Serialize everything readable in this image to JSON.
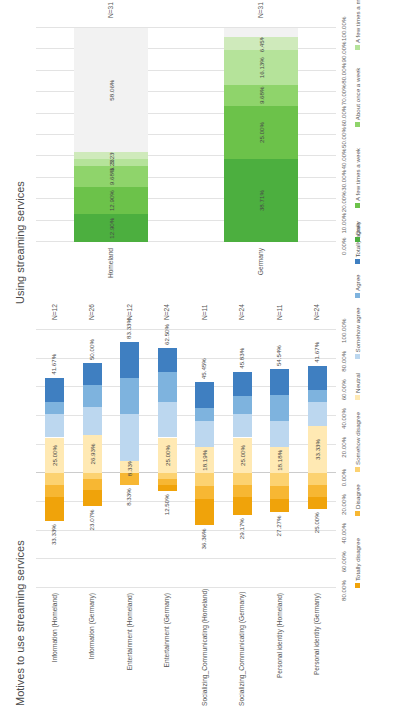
{
  "charts": {
    "motives": {
      "title": "Motives to use streaming services",
      "type": "diverging-bar",
      "categories": [
        "Information (Homeland)",
        "Information (Germany)",
        "Entertainment (Homeland)",
        "Entertainment (Germany)",
        "Socializing_Communicating (Homeland)",
        "Socializing_Communicating (Germany)",
        "Personal identity (Homeland)",
        "Personal identity (Germany)"
      ],
      "n_labels": [
        "N=12",
        "N=26",
        "N=12",
        "N=24",
        "N=11",
        "N=24",
        "N=11",
        "N=24"
      ],
      "legend": [
        {
          "label": "Totally disagree",
          "color": "#f0a30a"
        },
        {
          "label": "Disagree",
          "color": "#f7b733"
        },
        {
          "label": "Somehow disagree",
          "color": "#fcd271"
        },
        {
          "label": "Neutral",
          "color": "#ffe9b3"
        },
        {
          "label": "Somehow agree",
          "color": "#bcd7ef"
        },
        {
          "label": "Agree",
          "color": "#7eb3de"
        },
        {
          "label": "Totally agree",
          "color": "#3f7fc1"
        }
      ],
      "axis_ticks": [
        "80.00%",
        "60.00%",
        "40.00%",
        "20.00%",
        "0.00%",
        "20.00%",
        "40.00%",
        "60.00%",
        "80.00%",
        "100.00%"
      ],
      "axis_values": [
        -80,
        -60,
        -40,
        -20,
        0,
        20,
        40,
        60,
        80,
        100
      ],
      "negative_labels": [
        "33.33%",
        "23.07%",
        "8.33%",
        "12.50%",
        "36.36%",
        "29.17%",
        "27.27%",
        "25.00%"
      ],
      "neutral_labels": [
        "25.00%",
        "26.93%",
        "8.33%",
        "25.00%",
        "18.19%",
        "25.00%",
        "18.18%",
        "33.33%"
      ],
      "positive_labels": [
        "41.67%",
        "50.00%",
        "83.33%",
        "62.50%",
        "45.45%",
        "45.83%",
        "54.54%",
        "41.67%"
      ],
      "series": [
        {
          "name": "Totally disagree",
          "color": "#f0a30a",
          "values": [
            -16.67,
            -11.54,
            0,
            -4.17,
            -18.18,
            -12.5,
            -9.09,
            -8.33
          ]
        },
        {
          "name": "Disagree",
          "color": "#f7b733",
          "values": [
            -8.33,
            -7.69,
            -8.33,
            -4.17,
            -9.09,
            -8.33,
            -9.09,
            -8.33
          ]
        },
        {
          "name": "Somehow disagree",
          "color": "#fcd271",
          "values": [
            -8.33,
            -3.84,
            0,
            -4.16,
            -9.09,
            -8.34,
            -9.09,
            -8.34
          ]
        },
        {
          "name": "Neutral",
          "color": "#ffe9b3",
          "values": [
            25.0,
            26.93,
            8.33,
            25.0,
            18.19,
            25.0,
            18.18,
            33.33
          ]
        },
        {
          "name": "Somehow agree",
          "color": "#bcd7ef",
          "values": [
            16.67,
            19.23,
            33.33,
            25.0,
            18.18,
            16.67,
            18.18,
            16.67
          ]
        },
        {
          "name": "Agree",
          "color": "#7eb3de",
          "values": [
            8.33,
            15.38,
            25.0,
            20.83,
            9.09,
            12.5,
            18.18,
            8.33
          ]
        },
        {
          "name": "Totally agree",
          "color": "#3f7fc1",
          "values": [
            16.67,
            15.39,
            25.0,
            16.67,
            18.18,
            16.66,
            18.18,
            16.67
          ]
        }
      ]
    },
    "using": {
      "title": "Using streaming services",
      "type": "stacked-bar",
      "categories": [
        "Homeland",
        "Germany"
      ],
      "n_labels": [
        "N=31",
        "N=31"
      ],
      "legend": [
        {
          "label": "Daily",
          "color": "#4caf3f"
        },
        {
          "label": "A few times a week",
          "color": "#6cc24a"
        },
        {
          "label": "About once a week",
          "color": "#8fd46b"
        },
        {
          "label": "A few times a month",
          "color": "#b5e39a"
        },
        {
          "label": "About once a month",
          "color": "#cfeabb"
        },
        {
          "label": "A few times a year",
          "color": "#e4f3d6"
        },
        {
          "label": "Never",
          "color": "#f2f2f2"
        }
      ],
      "axis_ticks": [
        "0.00%",
        "10.00%",
        "20.00%",
        "30.00%",
        "40.00%",
        "50.00%",
        "60.00%",
        "70.00%",
        "80.00%",
        "90.00%",
        "100.00%"
      ],
      "axis_values": [
        0,
        10,
        20,
        30,
        40,
        50,
        60,
        70,
        80,
        90,
        100
      ],
      "series": [
        {
          "name": "Daily",
          "color": "#4caf3f",
          "values": [
            12.9,
            38.71
          ]
        },
        {
          "name": "A few times a week",
          "color": "#6cc24a",
          "values": [
            12.9,
            25.0
          ]
        },
        {
          "name": "About once a week",
          "color": "#8fd46b",
          "values": [
            9.68,
            9.68
          ]
        },
        {
          "name": "A few times a month",
          "color": "#b5e39a",
          "values": [
            3.23,
            16.13
          ]
        },
        {
          "name": "About once a month",
          "color": "#cfeabb",
          "values": [
            3.23,
            6.45
          ]
        },
        {
          "name": "A few times a year",
          "color": "#e4f3d6",
          "values": [
            0,
            0
          ]
        },
        {
          "name": "Never",
          "color": "#f2f2f2",
          "values": [
            58.06,
            4.03
          ]
        }
      ],
      "data_labels": {
        "Homeland": [
          "12.90%",
          "12.90%",
          "9.68%",
          "3.23%",
          "3.23%",
          "",
          "58.06%"
        ],
        "Germany": [
          "38.71%",
          "25.00%",
          "9.68%",
          "16.13%",
          "6.45%",
          "",
          ""
        ]
      }
    }
  }
}
